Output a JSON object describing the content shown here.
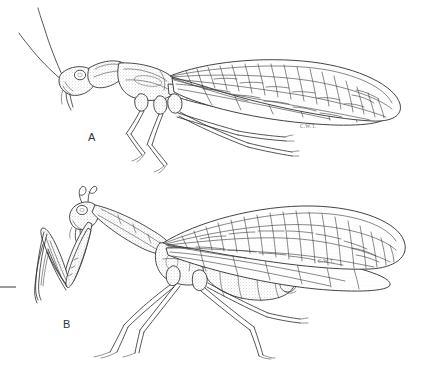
{
  "plate": {
    "title": "Comparative lateral habitus drawings of two neuropteroid insects",
    "medium": "pen-and-ink line drawing with stipple shading",
    "background_color": "#ffffff",
    "ink_color": "#2b2b2b",
    "label_color": "#333333",
    "signature_color": "#6a6a6a",
    "width_px": 431,
    "height_px": 369
  },
  "figures": [
    {
      "id": "A",
      "label": "A",
      "label_x": 88,
      "label_y": 141,
      "common_name": "snakefly",
      "orientation": "lateral view, facing left",
      "signature": "C.W.T.",
      "signature_x": 300,
      "signature_y": 128,
      "features": [
        "two long filiform antennae sweeping up and back",
        "large compound eye",
        "elongated tubular prothorax (neck)",
        "two pairs of membranous wings with dense reticulate venation",
        "three pairs of slender walking legs",
        "long tapering abdomen"
      ]
    },
    {
      "id": "B",
      "label": "B",
      "label_x": 63,
      "label_y": 328,
      "common_name": "mantidfly",
      "orientation": "lateral view, facing left",
      "signature": "C.W.T.",
      "signature_x": 318,
      "signature_y": 263,
      "features": [
        "short curled antennae",
        "large compound eye on triangular head",
        "greatly elongated prothorax",
        "raptorial (grasping) forelegs held folded, mantis-like",
        "two pairs of membranous wings with reticulate venation",
        "two pairs of slender walking legs",
        "stout segmented abdomen"
      ]
    }
  ],
  "marks": {
    "left_edge_rule": {
      "name": "scale-tick",
      "x1": 0,
      "y1": 287,
      "x2": 16,
      "y2": 287
    }
  }
}
